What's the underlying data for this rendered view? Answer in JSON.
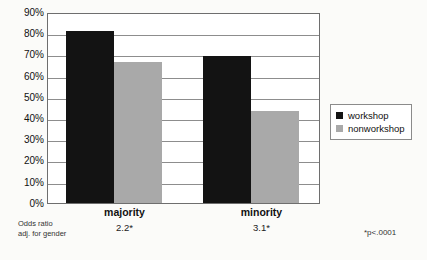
{
  "chart_data": {
    "type": "bar",
    "title": "",
    "subtitle": "",
    "xlabel": "",
    "ylabel": "",
    "categories": [
      "majority",
      "minority"
    ],
    "series": [
      {
        "name": "workshop",
        "color": "#131313",
        "values": [
          82,
          67
        ]
      },
      {
        "name": "nonworkshop",
        "color": "#a9a9a9",
        "values": [
          70,
          44
        ]
      }
    ],
    "series_by_category": {
      "majority": {
        "workshop": 82,
        "nonworkshop": 67
      },
      "minority": {
        "workshop": 70,
        "nonworkshop": 44
      }
    },
    "ylim": [
      0,
      90
    ],
    "ytick_step": 10,
    "ytick_labels": [
      "0%",
      "10%",
      "20%",
      "30%",
      "40%",
      "50%",
      "60%",
      "70%",
      "80%",
      "90%"
    ],
    "grid": true,
    "legend_position": "right",
    "annotations": {
      "odds_ratio_label_line1": "Odds ratio",
      "odds_ratio_label_line2": "adj. for gender",
      "odds_ratio_values": [
        "2.2*",
        "3.1*"
      ],
      "significance_note": "*p<.0001"
    }
  },
  "legend": {
    "items": [
      {
        "label": "workshop",
        "color": "#131313"
      },
      {
        "label": "nonworkshop",
        "color": "#a9a9a9"
      }
    ]
  },
  "axis": {
    "y_labels": [
      "90%",
      "80%",
      "70%",
      "60%",
      "50%",
      "40%",
      "30%",
      "20%",
      "10%",
      "0%"
    ]
  },
  "categories": [
    {
      "label": "majority",
      "odds_ratio": "2.2*"
    },
    {
      "label": "minority",
      "odds_ratio": "3.1*"
    }
  ],
  "footer": {
    "odds_line1": "Odds ratio",
    "odds_line2": "adj. for gender",
    "significance": "*p<.0001"
  }
}
